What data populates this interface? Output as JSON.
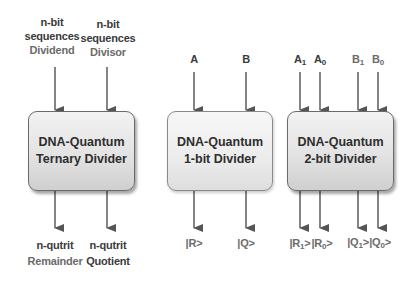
{
  "blocks": [
    {
      "id": "ternary",
      "title_line1": "DNA-Quantum",
      "title_line2": "Ternary  Divider",
      "inputs": [
        {
          "line1": "n-bit",
          "line2": "sequences",
          "line3": "Dividend"
        },
        {
          "line1": "n-bit",
          "line2": "sequences",
          "line3": "Divisor"
        }
      ],
      "outputs": [
        {
          "line1": "n-qutrit",
          "line2": "Remainder"
        },
        {
          "line1": "n-qutrit",
          "line2": "Quotient"
        }
      ]
    },
    {
      "id": "one-bit",
      "title_line1": "DNA-Quantum",
      "title_line2": "1-bit  Divider",
      "inputs": [
        {
          "label": "A"
        },
        {
          "label": "B"
        }
      ],
      "outputs": [
        {
          "label": "|R>"
        },
        {
          "label": "|Q>"
        }
      ]
    },
    {
      "id": "two-bit",
      "title_line1": "DNA-Quantum",
      "title_line2": "2-bit  Divider",
      "inputs": [
        {
          "base": "A",
          "sub": "1"
        },
        {
          "base": "A",
          "sub": "0"
        },
        {
          "base": "B",
          "sub": "1"
        },
        {
          "base": "B",
          "sub": "0"
        }
      ],
      "outputs": [
        {
          "pre": "|R",
          "sub": "1",
          "post": ">"
        },
        {
          "pre": "|R",
          "sub": "0",
          "post": ">"
        },
        {
          "pre": "|Q",
          "sub": "1",
          "post": ">"
        },
        {
          "pre": "|Q",
          "sub": "0",
          "post": ">"
        }
      ]
    }
  ],
  "colors": {
    "text_dark": "#3a3a3a",
    "text_gray": "#6b6b6b",
    "arrow": "#555555",
    "box_border": "#6a6a6a"
  }
}
